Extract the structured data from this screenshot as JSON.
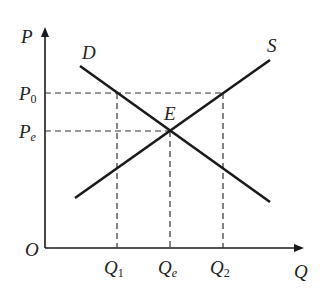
{
  "diagram": {
    "axes": {
      "y_label": "P",
      "x_label": "Q",
      "origin_label": "O"
    },
    "curves": [
      {
        "name": "D",
        "label": "D",
        "type": "demand"
      },
      {
        "name": "S",
        "label": "S",
        "type": "supply"
      }
    ],
    "equilibrium_label": "E",
    "price_labels": [
      {
        "base": "P",
        "sub": "0"
      },
      {
        "base": "P",
        "sub": "e"
      }
    ],
    "quantity_labels": [
      {
        "base": "Q",
        "sub": "1"
      },
      {
        "base": "Q",
        "sub": "e"
      },
      {
        "base": "Q",
        "sub": "2"
      }
    ],
    "colors": {
      "line": "#1a1a1a",
      "dash": "#333333",
      "background": "#ffffff"
    }
  }
}
